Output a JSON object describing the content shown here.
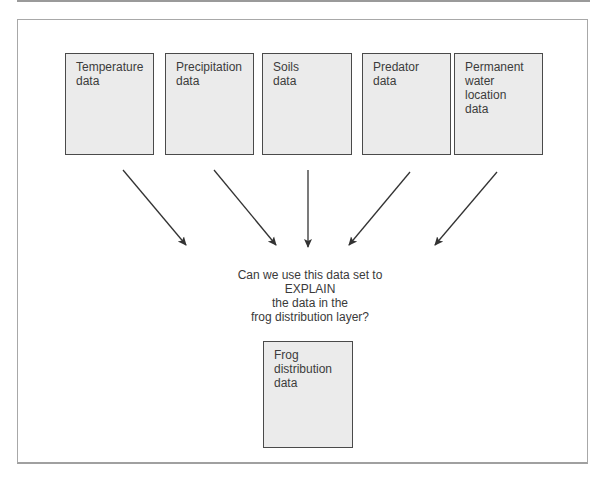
{
  "diagram": {
    "source_layers": [
      {
        "id": "temperature",
        "label": "Temperature\ndata"
      },
      {
        "id": "precipitation",
        "label": "Precipitation\ndata"
      },
      {
        "id": "soils",
        "label": "Soils\ndata"
      },
      {
        "id": "predator",
        "label": "Predator\ndata"
      },
      {
        "id": "permanent-water",
        "label": "Permanent\nwater\nlocation\ndata"
      }
    ],
    "question": "Can we use this data set to\nEXPLAIN\nthe data in the\nfrog distribution layer?",
    "target_layer": {
      "id": "frog-distribution",
      "label": "Frog\ndistribution\ndata"
    },
    "colors": {
      "box_fill": "#ebebeb",
      "box_border": "#4a4a4a",
      "arrow": "#333333",
      "frame": "#a8a8a8"
    }
  }
}
